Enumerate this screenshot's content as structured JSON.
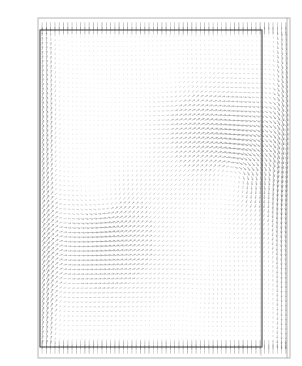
{
  "figure": {
    "title": "",
    "artifact_text": "· ·",
    "background_color": "#ffffff",
    "vector_color": "#6e6e6e",
    "frame_color": "#9a9a9a",
    "inner_frame_color": "#3c3c3c"
  },
  "chart_data": {
    "type": "quiver",
    "title": "",
    "subtitle": "",
    "xlabel": "",
    "ylabel": "",
    "xlim": [
      0,
      1
    ],
    "ylim": [
      0,
      1
    ],
    "grid": false,
    "legend": "none",
    "annotations": [],
    "xticklabels": [],
    "yticklabels": [],
    "domain": {
      "outer_frame": {
        "x0": 38,
        "y0": 18,
        "x1": 290,
        "y1": 358
      },
      "inner_frame": {
        "x0": 52,
        "y0": 30,
        "x1": 262,
        "y1": 347
      },
      "right_wall_line_x": 287,
      "secondary_wall_line_x": 261
    },
    "grid_resolution": {
      "nx": 58,
      "ny": 72
    },
    "vortices": [
      {
        "name": "primary-vortex-right",
        "cx": 0.78,
        "cy": 0.54,
        "strength": -1.0,
        "radius": 0.3
      },
      {
        "name": "secondary-vortex-left",
        "cx": 0.26,
        "cy": 0.45,
        "strength": 0.72,
        "radius": 0.34
      },
      {
        "name": "upper-vortex",
        "cx": 0.52,
        "cy": 0.8,
        "strength": 0.45,
        "radius": 0.26
      },
      {
        "name": "lower-corner-vortex",
        "cx": 0.62,
        "cy": 0.16,
        "strength": -0.4,
        "radius": 0.22
      }
    ],
    "boundary_rows": {
      "top_lid": {
        "direction": "vertical",
        "density": "high"
      },
      "bottom_wall": {
        "direction": "vertical",
        "density": "high"
      },
      "left_wall": {
        "direction": "vertical",
        "density": "medium"
      },
      "right_outlet": {
        "direction": "vertical",
        "density": "medium"
      }
    },
    "max_vector_length_px": 6.5,
    "series": [
      {
        "name": "velocity-field",
        "units": "m/s",
        "components": [
          "u",
          "v"
        ],
        "note": "Arrow length encodes velocity magnitude; arrow direction encodes flow direction."
      }
    ]
  }
}
